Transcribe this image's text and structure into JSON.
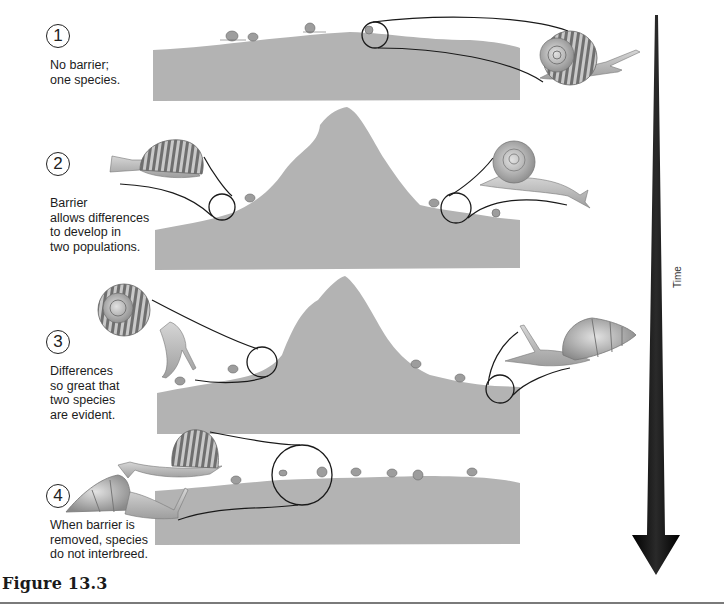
{
  "figure": {
    "caption": "Figure 13.3",
    "axis_label": "Time",
    "colors": {
      "ground": "#b3b3b3",
      "arrow": "#111111",
      "outline": "#1a1a1a",
      "snail_shell": "#9a9a9a",
      "snail_body": "#c4c4c4"
    }
  },
  "steps": [
    {
      "number": "1",
      "text": "No barrier;\none species.",
      "scene": "flat-ground"
    },
    {
      "number": "2",
      "text": "Barrier\nallows differences\nto develop in\ntwo populations.",
      "scene": "mountain-barrier"
    },
    {
      "number": "3",
      "text": "Differences\nso great that\ntwo species\nare evident.",
      "scene": "mountain-barrier"
    },
    {
      "number": "4",
      "text": "When barrier is\nremoved, species\ndo not interbreed.",
      "scene": "flat-ground"
    }
  ]
}
